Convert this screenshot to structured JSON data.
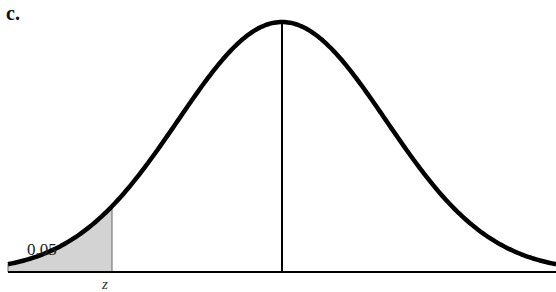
{
  "panel_label": "c.",
  "chart_data": {
    "type": "area",
    "title": "",
    "distribution": "normal",
    "mean_line": true,
    "shaded_region": {
      "tail": "left",
      "area": 0.05,
      "bound_label": "z"
    },
    "annotations": [
      {
        "text": "0.05",
        "position": "inside shaded left tail"
      },
      {
        "text": "z",
        "position": "below x-axis at shading boundary"
      }
    ],
    "xlabel": "",
    "ylabel": "",
    "grid": false,
    "legend": null
  },
  "labels": {
    "area": "0.05",
    "tick": "z"
  },
  "colors": {
    "curve": "#000000",
    "shade": "#d3d3d3",
    "axis": "#000000"
  }
}
